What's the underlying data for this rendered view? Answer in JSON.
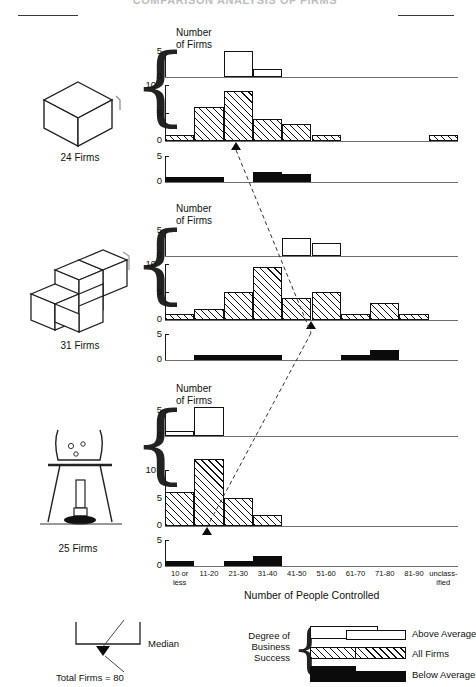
{
  "title": "COMPARISON ANALYSIS OF FIRMS",
  "axis": {
    "y_label_line1": "Number",
    "y_label_line2": "of Firms",
    "x_title": "Number of People Controlled",
    "x_categories": [
      "10 or\nless",
      "11-20",
      "21-30",
      "31-40",
      "41-50",
      "51-60",
      "61-70",
      "71-80",
      "81-90",
      "unclass-\nified"
    ],
    "y_ticks_above": [
      "0",
      "5"
    ],
    "y_ticks_all": [
      "0",
      "5",
      "10"
    ],
    "y_ticks_below": [
      "0",
      "5"
    ]
  },
  "groups": [
    {
      "icon": "cube-icon",
      "label": "24 Firms"
    },
    {
      "icon": "stacked-cubes-icon",
      "label": "31 Firms"
    },
    {
      "icon": "beaker-burner-icon",
      "label": "25 Firms"
    }
  ],
  "legend": {
    "median_label": "Median",
    "total_label": "Total Firms = 80",
    "group_title_line1": "Degree of",
    "group_title_line2": "Business",
    "group_title_line3": "Success",
    "items": [
      {
        "key": "above",
        "label": "Above Average"
      },
      {
        "key": "all",
        "label": "All Firms"
      },
      {
        "key": "below",
        "label": "Below Average"
      }
    ]
  },
  "colors": {
    "ink": "#111111",
    "axis": "#6f6f6f",
    "fill_below": "#0b0b0b",
    "paper": "#ffffff"
  },
  "chart_data": {
    "type": "bar",
    "title": "COMPARISON ANALYSIS OF FIRMS",
    "xlabel": "Number of People Controlled",
    "ylabel": "Number of Firms",
    "grid": false,
    "legend_position": "bottom-right",
    "categories": [
      "10 or less",
      "11-20",
      "21-30",
      "31-40",
      "41-50",
      "51-60",
      "61-70",
      "71-80",
      "81-90",
      "unclassified"
    ],
    "panels": [
      {
        "name": "24 Firms",
        "icon": "cube-icon",
        "total": 24,
        "median_category": "21-30",
        "series": [
          {
            "name": "Above Average",
            "ylim": [
              0,
              5
            ],
            "values": [
              0,
              0,
              5,
              1.5,
              0,
              0,
              0,
              0,
              0,
              0
            ]
          },
          {
            "name": "All Firms",
            "ylim": [
              0,
              10
            ],
            "values": [
              1,
              6,
              9,
              4,
              3,
              1,
              0,
              0,
              0,
              1
            ]
          },
          {
            "name": "Below Average",
            "ylim": [
              0,
              5
            ],
            "values": [
              1,
              1,
              0,
              2,
              1.5,
              0,
              0,
              0,
              0,
              0
            ]
          }
        ]
      },
      {
        "name": "31 Firms",
        "icon": "stacked-cubes-icon",
        "total": 31,
        "median_category": "41-50",
        "series": [
          {
            "name": "Above Average",
            "ylim": [
              0,
              5
            ],
            "values": [
              0,
              0,
              0,
              0,
              3.5,
              2.5,
              0,
              0,
              0,
              0
            ]
          },
          {
            "name": "All Firms",
            "ylim": [
              0,
              10
            ],
            "values": [
              1,
              2,
              5,
              9.5,
              4,
              5,
              1,
              3,
              1,
              0
            ]
          },
          {
            "name": "Below Average",
            "ylim": [
              0,
              5
            ],
            "values": [
              0,
              1,
              1,
              1,
              0,
              0,
              1,
              2,
              0,
              0
            ]
          }
        ]
      },
      {
        "name": "25 Firms",
        "icon": "beaker-burner-icon",
        "total": 25,
        "median_category": "11-20",
        "series": [
          {
            "name": "Above Average",
            "ylim": [
              0,
              5
            ],
            "values": [
              1,
              5.5,
              0,
              0,
              0,
              0,
              0,
              0,
              0,
              0
            ]
          },
          {
            "name": "All Firms",
            "ylim": [
              0,
              10
            ],
            "values": [
              6,
              12,
              5,
              2,
              0,
              0,
              0,
              0,
              0,
              0
            ]
          },
          {
            "name": "Below Average",
            "ylim": [
              0,
              5
            ],
            "values": [
              1,
              0,
              1,
              2,
              0,
              0,
              0,
              0,
              0,
              0
            ]
          }
        ]
      }
    ],
    "annotations": [
      {
        "type": "median-connector",
        "label": "Median",
        "note": "dashed line linking panel medians"
      },
      {
        "type": "total",
        "label": "Total Firms = 80"
      }
    ]
  }
}
